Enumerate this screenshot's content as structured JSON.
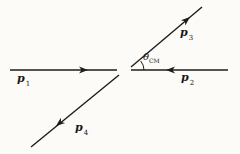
{
  "diagram": {
    "description_name": "cm-frame-two-body-scattering-momentum-diagram"
  },
  "labels": {
    "p1": {
      "base": "p",
      "sub": "1"
    },
    "p2": {
      "base": "p",
      "sub": "2"
    },
    "p3": {
      "base": "p",
      "sub": "3"
    },
    "p4": {
      "base": "p",
      "sub": "4"
    },
    "theta": {
      "base": "θ",
      "sub": "CM"
    }
  },
  "vectors": {
    "p1": {
      "x1": 10,
      "y1": 70,
      "x2": 117,
      "y2": 70,
      "arrow": {
        "x": 88,
        "y": 70,
        "angle": 0
      }
    },
    "p2": {
      "x1": 228,
      "y1": 70,
      "x2": 131,
      "y2": 70,
      "arrow": {
        "x": 166,
        "y": 70,
        "angle": 180
      }
    },
    "p3": {
      "x1": 131,
      "y1": 67,
      "x2": 202,
      "y2": 7,
      "arrow": {
        "x": 190,
        "y": 17,
        "angle": -40.2
      }
    },
    "p4": {
      "x1": 119,
      "y1": 75,
      "x2": 31,
      "y2": 147,
      "arrow": {
        "x": 56,
        "y": 126,
        "angle": 140.7
      }
    }
  },
  "angle_arc": {
    "d": "M 144 70 A 14 14 0 0 0 140.7 61"
  },
  "colors": {
    "line": "#1c1c1c",
    "background": "#fcfbf8",
    "text": "#161616"
  }
}
